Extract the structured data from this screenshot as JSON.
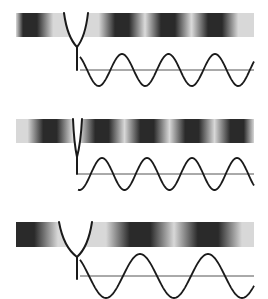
{
  "colors": {
    "background": "#ffffff",
    "ink": "#1a1a1a",
    "band_dark": "#2a2a2a",
    "band_light": "#d8d8d8",
    "baseline": "#555555"
  },
  "panels": [
    {
      "name": "panel-1",
      "band": {
        "x": 16,
        "y": 13,
        "w": 238,
        "h": 24
      },
      "fork": {
        "left_top": [
          64,
          13
        ],
        "right_top": [
          88,
          13
        ],
        "join": [
          77,
          47
        ],
        "stem_end": 70,
        "curve": "medium"
      },
      "wave": {
        "x0": 80,
        "x1": 254,
        "baseline_y": 70,
        "amplitude": 16,
        "period": 46.5,
        "first_peak_x": 122
      },
      "dark_centers": [
        30,
        122,
        168,
        215
      ]
    },
    {
      "name": "panel-2",
      "band": {
        "x": 16,
        "y": 119,
        "w": 238,
        "h": 24
      },
      "fork": {
        "left_top": [
          73,
          119
        ],
        "right_top": [
          82,
          119
        ],
        "join": [
          77,
          157
        ],
        "stem_end": 174,
        "curve": "narrow"
      },
      "wave": {
        "x0": 78,
        "x1": 254,
        "baseline_y": 174,
        "amplitude": 16,
        "period": 45,
        "first_peak_x": 102
      },
      "dark_centers": [
        50,
        102,
        147,
        192,
        237
      ]
    },
    {
      "name": "panel-3",
      "band": {
        "x": 16,
        "y": 222,
        "w": 238,
        "h": 25
      },
      "fork": {
        "left_top": [
          59,
          222
        ],
        "right_top": [
          92,
          222
        ],
        "join": [
          77,
          257
        ],
        "stem_end": 279,
        "curve": "wide"
      },
      "wave": {
        "x0": 80,
        "x1": 254,
        "baseline_y": 276,
        "amplitude": 22,
        "period": 68,
        "first_peak_x": 140
      },
      "dark_centers": [
        24,
        140,
        208
      ]
    }
  ]
}
